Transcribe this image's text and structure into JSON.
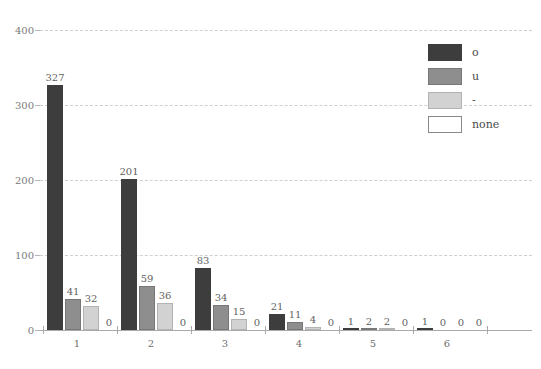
{
  "chart_data": {
    "type": "bar",
    "title": "",
    "subtitle": "",
    "xlabel": "",
    "ylabel": "",
    "categories": [
      "1",
      "2",
      "3",
      "4",
      "5",
      "6"
    ],
    "series": [
      {
        "name": "o",
        "color": "#3d3d3d",
        "values": [
          327,
          201,
          83,
          21,
          1,
          1
        ]
      },
      {
        "name": "u",
        "color": "#8e8e8e",
        "values": [
          41,
          59,
          34,
          11,
          2,
          0
        ]
      },
      {
        "name": "-",
        "color": "#d2d2d2",
        "values": [
          32,
          36,
          15,
          4,
          2,
          0
        ]
      },
      {
        "name": "none",
        "color": "#ffffff",
        "values": [
          0,
          0,
          0,
          0,
          0,
          0
        ]
      }
    ],
    "ylim": [
      0,
      400
    ],
    "yticks": [
      0,
      100,
      200,
      300,
      400
    ],
    "ytick_labels": [
      "0",
      "100",
      "200",
      "300",
      "400"
    ],
    "grid": true,
    "grid_style": "dashed",
    "grid_color": "#cfcfcf",
    "legend_position": "top-right",
    "legend_entries": [
      "o",
      "u",
      "-",
      "none"
    ],
    "data_labels": true
  },
  "axis": {
    "axis_color": "#aaaaaa",
    "tick_label_color": "#7a7a7a"
  }
}
